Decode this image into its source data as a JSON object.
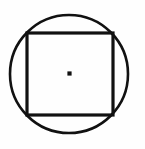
{
  "figure": {
    "canvas": {
      "width": 145,
      "height": 149,
      "background_color": "#fefefe"
    },
    "stroke_color": "#111111",
    "fill_color": "none",
    "shapes": [
      {
        "name": "circle",
        "type": "circle",
        "center_x": 69,
        "center_y": 74,
        "radius": 59,
        "stroke_width": 2.6,
        "stroke_color": "#111111",
        "fill": "none"
      },
      {
        "name": "square",
        "type": "rect",
        "x": 27,
        "y": 33,
        "width": 86,
        "height": 82,
        "stroke_width": 3.2,
        "stroke_color": "#111111",
        "fill": "none"
      },
      {
        "name": "center-point",
        "type": "point",
        "center_x": 69.5,
        "center_y": 73.5,
        "size": 4.2,
        "fill": "#111111"
      }
    ]
  },
  "chart_data": {
    "type": "diagram",
    "xlabel": "",
    "ylabel": "",
    "elements": [
      {
        "label": "circle",
        "shape": "circle",
        "center": [
          69,
          74
        ],
        "radius": 59
      },
      {
        "label": "square",
        "shape": "square",
        "corners": [
          [
            27,
            33
          ],
          [
            113,
            33
          ],
          [
            113,
            115
          ],
          [
            27,
            115
          ]
        ],
        "side_width": 86,
        "side_height": 82
      },
      {
        "label": "center point",
        "shape": "dot",
        "center": [
          69.5,
          73.5
        ],
        "size": 4.2
      }
    ]
  }
}
